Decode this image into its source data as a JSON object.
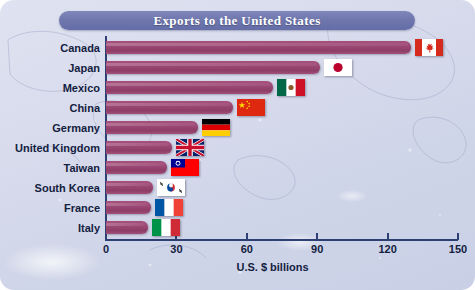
{
  "figure": {
    "title": "Exports to the United States",
    "background_color": "#d5dae9",
    "banner_color": "#6f77ad",
    "bar_color": "#9c4874",
    "axis_color": "#2e3f73"
  },
  "chart_data": {
    "type": "bar",
    "orientation": "horizontal",
    "title": "Exports to the United States",
    "xlabel": "U.S. $ billions",
    "ylabel": "",
    "xlim": [
      0,
      150
    ],
    "xticks": [
      0,
      30,
      60,
      90,
      120,
      150
    ],
    "xtick_labels": [
      "0",
      "30",
      "60",
      "90",
      "120",
      "150"
    ],
    "grid": false,
    "legend": "none",
    "categories": [
      "Canada",
      "Japan",
      "Mexico",
      "China",
      "Germany",
      "United Kingdom",
      "Taiwan",
      "South Korea",
      "France",
      "Italy"
    ],
    "values": [
      130,
      91,
      71,
      54,
      39,
      28,
      26,
      20,
      19,
      18
    ],
    "annotations": [
      "country flag icon at the end of each bar"
    ]
  },
  "axis": {
    "x_title": "U.S. $ billions",
    "ticks": [
      {
        "value": 0,
        "label": "0"
      },
      {
        "value": 30,
        "label": "30"
      },
      {
        "value": 60,
        "label": "60"
      },
      {
        "value": 90,
        "label": "90"
      },
      {
        "value": 120,
        "label": "120"
      },
      {
        "value": 150,
        "label": "150"
      }
    ]
  },
  "rows": [
    {
      "label": "Canada",
      "value": 130,
      "flag": "flag-canada"
    },
    {
      "label": "Japan",
      "value": 91,
      "flag": "flag-japan"
    },
    {
      "label": "Mexico",
      "value": 71,
      "flag": "flag-mexico"
    },
    {
      "label": "China",
      "value": 54,
      "flag": "flag-china"
    },
    {
      "label": "Germany",
      "value": 39,
      "flag": "flag-germany"
    },
    {
      "label": "United Kingdom",
      "value": 28,
      "flag": "flag-united-kingdom"
    },
    {
      "label": "Taiwan",
      "value": 26,
      "flag": "flag-taiwan"
    },
    {
      "label": "South Korea",
      "value": 20,
      "flag": "flag-south-korea"
    },
    {
      "label": "France",
      "value": 19,
      "flag": "flag-france"
    },
    {
      "label": "Italy",
      "value": 18,
      "flag": "flag-italy"
    }
  ]
}
